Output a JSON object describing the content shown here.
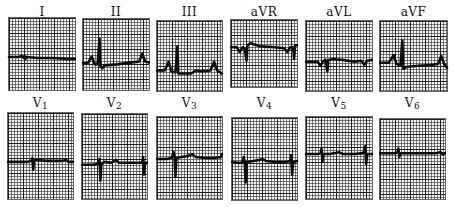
{
  "ecg": {
    "trace_color": "#0b0b0b",
    "grid_color": "#222222",
    "row1": [
      {
        "id": "I",
        "label": "I",
        "sub": ""
      },
      {
        "id": "II",
        "label": "II",
        "sub": ""
      },
      {
        "id": "III",
        "label": "III",
        "sub": ""
      },
      {
        "id": "aVR",
        "label": "aVR",
        "sub": ""
      },
      {
        "id": "aVL",
        "label": "aVL",
        "sub": ""
      },
      {
        "id": "aVF",
        "label": "aVF",
        "sub": ""
      }
    ],
    "row2": [
      {
        "id": "V1",
        "label": "V",
        "sub": "1"
      },
      {
        "id": "V2",
        "label": "V",
        "sub": "2"
      },
      {
        "id": "V3",
        "label": "V",
        "sub": "3"
      },
      {
        "id": "V4",
        "label": "V",
        "sub": "4"
      },
      {
        "id": "V5",
        "label": "V",
        "sub": "5"
      },
      {
        "id": "V6",
        "label": "V",
        "sub": "6"
      }
    ]
  }
}
